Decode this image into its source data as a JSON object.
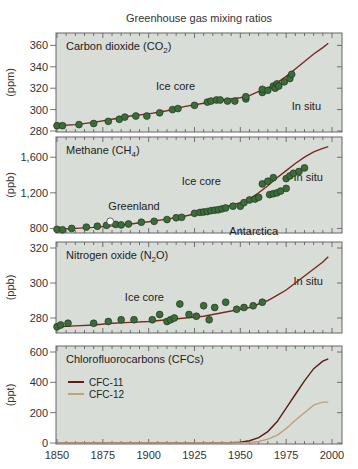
{
  "chart_data": {
    "type": "line",
    "title": "Greenhouse gas mixing ratios",
    "xlabel": "",
    "xlim": [
      1850,
      2000
    ],
    "xticks": [
      1850,
      1875,
      1900,
      1925,
      1950,
      1975,
      2000
    ],
    "xtick_labels": [
      "1850",
      "1875",
      "1900",
      "1925",
      "1950",
      "1975",
      "2000"
    ],
    "colors": {
      "panel_bg": "#d8ddd8",
      "frame": "#666666",
      "curve": "#7a2a1e",
      "point_fill": "#3d6b3a",
      "point_stroke": "#1e3a1c",
      "cfc11": "#5a1e14",
      "cfc12": "#c2a07a"
    },
    "panels": [
      {
        "id": "co2",
        "label": "Carbon dioxide (CO",
        "label_sub": "2",
        "label_tail": ")",
        "ylabel": "(ppm)",
        "ylim": [
          280,
          366
        ],
        "yticks": [
          280,
          300,
          320,
          340,
          360
        ],
        "ytick_labels": [
          "280",
          "300",
          "320",
          "340",
          "360"
        ],
        "annotations": [
          {
            "text": "Ice core",
            "x": 1904,
            "y": 318
          },
          {
            "text": "In situ",
            "x": 1978,
            "y": 300
          }
        ],
        "series": [
          {
            "name": "CO2 fit",
            "kind": "line",
            "x": [
              1850,
              1860,
              1870,
              1880,
              1890,
              1900,
              1910,
              1920,
              1930,
              1940,
              1950,
              1955,
              1960,
              1965,
              1970,
              1975,
              1980,
              1985,
              1990,
              1995,
              1998
            ],
            "y": [
              285,
              286,
              288,
              291,
              294,
              296,
              299,
              303,
              306,
              309,
              311,
              313,
              317,
              320,
              325,
              331,
              338,
              345,
              352,
              358,
              362
            ]
          },
          {
            "name": "Ice core",
            "kind": "points",
            "x": [
              1850,
              1853,
              1862,
              1870,
              1878,
              1884,
              1887,
              1893,
              1899,
              1906,
              1913,
              1916,
              1925,
              1932,
              1934,
              1937,
              1939,
              1943,
              1947,
              1953,
              1953,
              1962,
              1962,
              1965,
              1968,
              1969,
              1970,
              1971,
              1974,
              1977,
              1978
            ],
            "y": [
              285,
              285,
              286,
              287,
              289,
              291,
              293,
              294,
              294,
              297,
              300,
              301,
              304,
              307,
              308,
              309,
              309,
              308,
              308,
              310,
              312,
              316,
              319,
              318,
              322,
              320,
              324,
              322,
              326,
              329,
              333
            ]
          }
        ]
      },
      {
        "id": "ch4",
        "label": "Methane (CH",
        "label_sub": "4",
        "label_tail": ")",
        "ylabel": "(ppb)",
        "ylim": [
          760,
          1760
        ],
        "yticks": [
          800,
          1200,
          1600
        ],
        "ytick_labels": [
          "800",
          "1,200",
          "1,600"
        ],
        "annotations": [
          {
            "text": "Greenland",
            "x": 1878,
            "y": 1010
          },
          {
            "text": "Ice core",
            "x": 1918,
            "y": 1290
          },
          {
            "text": "Antarctica",
            "x": 1944,
            "y": 730
          },
          {
            "text": "In situ",
            "x": 1979,
            "y": 1330
          }
        ],
        "series": [
          {
            "name": "CH4 fit",
            "kind": "line",
            "x": [
              1850,
              1860,
              1870,
              1880,
              1890,
              1900,
              1910,
              1920,
              1930,
              1940,
              1950,
              1955,
              1960,
              1965,
              1970,
              1975,
              1980,
              1985,
              1990,
              1995,
              1998
            ],
            "y": [
              790,
              800,
              812,
              828,
              850,
              875,
              905,
              940,
              985,
              1030,
              1090,
              1130,
              1200,
              1280,
              1370,
              1450,
              1530,
              1600,
              1660,
              1700,
              1720
            ]
          },
          {
            "name": "Ice core",
            "kind": "points",
            "x": [
              1850,
              1853,
              1858,
              1866,
              1872,
              1877,
              1882,
              1885,
              1889,
              1896,
              1903,
              1910,
              1915,
              1918,
              1925,
              1928,
              1930,
              1932,
              1934,
              1936,
              1938,
              1940,
              1942,
              1946,
              1950,
              1952,
              1955,
              1958,
              1960,
              1966,
              1968,
              1970,
              1972,
              1975
            ],
            "y": [
              790,
              785,
              800,
              815,
              825,
              835,
              845,
              840,
              850,
              870,
              880,
              900,
              920,
              925,
              970,
              980,
              985,
              990,
              1000,
              1005,
              1010,
              1020,
              1030,
              1050,
              1050,
              1090,
              1120,
              1130,
              1150,
              1180,
              1190,
              1200,
              1220,
              1250
            ]
          },
          {
            "name": "Antarctica/late",
            "kind": "points",
            "x": [
              1962,
              1965,
              1968,
              1975,
              1977,
              1979,
              1982,
              1985
            ],
            "y": [
              1300,
              1330,
              1370,
              1360,
              1390,
              1420,
              1440,
              1480
            ]
          },
          {
            "name": "Greenland open",
            "kind": "open-point",
            "x": [
              1879
            ],
            "y": [
              880
            ]
          }
        ]
      },
      {
        "id": "n2o",
        "label": "Nitrogen oxide (N",
        "label_sub": "2",
        "label_tail": "O)",
        "ylabel": "(ppb)",
        "ylim": [
          272,
          320
        ],
        "yticks": [
          280,
          300,
          320
        ],
        "ytick_labels": [
          "280",
          "300",
          "320"
        ],
        "annotations": [
          {
            "text": "Ice core",
            "x": 1887,
            "y": 290
          },
          {
            "text": "In situ",
            "x": 1979,
            "y": 299
          }
        ],
        "series": [
          {
            "name": "N2O fit",
            "kind": "line",
            "x": [
              1850,
              1860,
              1870,
              1880,
              1890,
              1900,
              1910,
              1920,
              1930,
              1940,
              1950,
              1955,
              1960,
              1965,
              1970,
              1975,
              1980,
              1985,
              1990,
              1995,
              1998
            ],
            "y": [
              275,
              275.5,
              276,
              277,
              277.5,
              278,
              279,
              280,
              281,
              283,
              285,
              286,
              288,
              290,
              293,
              296,
              300,
              304,
              308,
              312,
              315
            ]
          },
          {
            "name": "Ice core",
            "kind": "points",
            "x": [
              1850,
              1852,
              1856,
              1870,
              1878,
              1885,
              1892,
              1902,
              1906,
              1910,
              1912,
              1914,
              1917,
              1922,
              1926,
              1930,
              1933,
              1936,
              1942,
              1948,
              1952,
              1957,
              1962
            ],
            "y": [
              275,
              276,
              277,
              277,
              278,
              279,
              279,
              279,
              282,
              278,
              279,
              280,
              288,
              282,
              281,
              287,
              279,
              286,
              289,
              285,
              286,
              287,
              289
            ]
          }
        ]
      },
      {
        "id": "cfc",
        "label": "Chlorofluorocarbons (CFCs)",
        "label_sub": "",
        "label_tail": "",
        "ylabel": "(ppt)",
        "ylim": [
          0,
          600
        ],
        "yticks": [
          0,
          200,
          400,
          600
        ],
        "ytick_labels": [
          "0",
          "200",
          "400",
          "600"
        ],
        "annotations": [],
        "legend": [
          {
            "name": "CFC-11",
            "color_key": "cfc11"
          },
          {
            "name": "CFC-12",
            "color_key": "cfc12"
          }
        ],
        "series": [
          {
            "name": "CFC-11",
            "kind": "line",
            "color_key": "cfc11",
            "x": [
              1850,
              1940,
              1945,
              1950,
              1955,
              1960,
              1965,
              1970,
              1975,
              1980,
              1985,
              1990,
              1995,
              1998
            ],
            "y": [
              0,
              0,
              2,
              5,
              15,
              35,
              75,
              140,
              230,
              320,
              410,
              490,
              540,
              555
            ]
          },
          {
            "name": "CFC-12",
            "kind": "line",
            "color_key": "cfc12",
            "x": [
              1850,
              1950,
              1955,
              1960,
              1965,
              1970,
              1975,
              1980,
              1985,
              1990,
              1995,
              1998
            ],
            "y": [
              0,
              0,
              3,
              10,
              25,
              50,
              95,
              150,
              200,
              250,
              270,
              270
            ]
          }
        ]
      }
    ]
  }
}
